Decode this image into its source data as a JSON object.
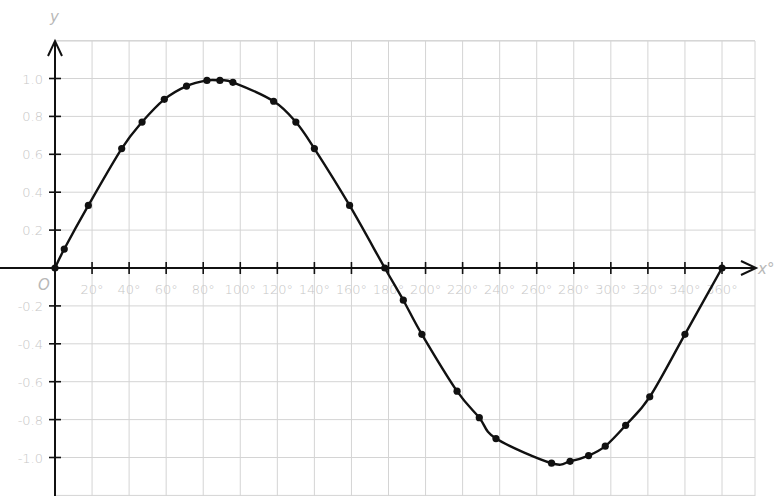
{
  "chart_data": {
    "type": "line",
    "title": "",
    "xlabel": "x°",
    "ylabel": "y",
    "origin_label": "O",
    "xlim": [
      0,
      378
    ],
    "ylim": [
      -1.2,
      1.2
    ],
    "grid": true,
    "x_ticks": [
      20,
      40,
      60,
      80,
      100,
      120,
      140,
      160,
      180,
      200,
      220,
      240,
      260,
      280,
      300,
      320,
      340,
      360
    ],
    "x_tick_labels": [
      "20°",
      "40°",
      "60°",
      "80°",
      "100°",
      "120°",
      "140°",
      "160°",
      "180°",
      "200°",
      "220°",
      "240°",
      "260°",
      "280°",
      "300°",
      "320°",
      "340°",
      "360°"
    ],
    "y_ticks": [
      1.0,
      0.8,
      0.6,
      0.4,
      0.2,
      -0.2,
      -0.4,
      -0.6,
      -0.8,
      -1.0
    ],
    "y_tick_labels": [
      "1.0",
      "0.8",
      "0.6",
      "0.4",
      "0.2",
      "-0.2",
      "-0.4",
      "-0.6",
      "-0.8",
      "-1.0"
    ],
    "series": [
      {
        "name": "y = sin x (plotted points)",
        "marker": "dot",
        "x": [
          0,
          5,
          18,
          36,
          47,
          59,
          71,
          82,
          89,
          96,
          118,
          130,
          140,
          159,
          178,
          188,
          198,
          217,
          229,
          238,
          268,
          278,
          288,
          297,
          308,
          321,
          340,
          360
        ],
        "y": [
          0,
          0.1,
          0.33,
          0.63,
          0.77,
          0.89,
          0.96,
          0.99,
          0.99,
          0.98,
          0.88,
          0.77,
          0.63,
          0.33,
          0,
          -0.17,
          -0.35,
          -0.65,
          -0.79,
          -0.9,
          -1.03,
          -1.02,
          -0.99,
          -0.94,
          -0.83,
          -0.68,
          -0.35,
          0
        ]
      }
    ]
  },
  "colors": {
    "grid": "#d4d4d4",
    "axis": "#111111",
    "curve": "#111111",
    "labels": "#c6c6c6"
  }
}
